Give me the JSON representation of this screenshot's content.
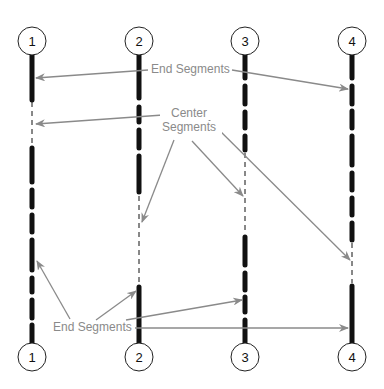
{
  "diagram": {
    "line_numbers_top": [
      "1",
      "2",
      "3",
      "4"
    ],
    "line_numbers_bottom": [
      "1",
      "2",
      "3",
      "4"
    ],
    "labels": {
      "end_segments_top": "End Segments",
      "center_segments_line1": "Center",
      "center_segments_line2": "Segments",
      "end_segments_bottom": "End Segments"
    },
    "colors": {
      "line": "#111111",
      "arrow": "#8a8a8a",
      "text": "#8a8a8a",
      "circle": "#222222"
    }
  }
}
